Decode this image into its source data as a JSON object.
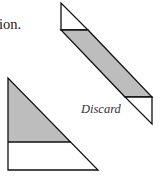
{
  "text": {
    "caption_fragment": "ion.",
    "discard_label": "Discard"
  },
  "colors": {
    "fill_gray": "#bdbdbd",
    "fill_white": "#ffffff",
    "stroke": "#111111"
  },
  "shapes": {
    "strip": {
      "top_triangle": [
        [
          61,
          3
        ],
        [
          61,
          30
        ],
        [
          88,
          30
        ]
      ],
      "parallelogram": [
        [
          61,
          30
        ],
        [
          88,
          30
        ],
        [
          152,
          97
        ],
        [
          125,
          97
        ]
      ],
      "bottom_triangle": [
        [
          125,
          97
        ],
        [
          152,
          97
        ],
        [
          152,
          124
        ]
      ]
    },
    "triangle": {
      "outline": [
        [
          8,
          78
        ],
        [
          8,
          170
        ],
        [
          98,
          170
        ]
      ],
      "divider_y": 142,
      "divider_x_end": 71
    }
  }
}
